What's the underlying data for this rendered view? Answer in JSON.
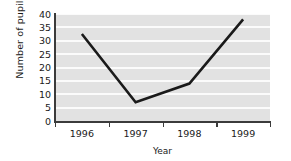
{
  "chart_data": {
    "type": "line",
    "title": "",
    "xlabel": "Year",
    "ylabel": "Number of pupils",
    "categories": [
      "1996",
      "1997",
      "1998",
      "1999"
    ],
    "values": [
      32.5,
      7,
      14,
      38
    ],
    "series": [
      {
        "name": "Number of pupils",
        "values": [
          32.5,
          7,
          14,
          38
        ]
      }
    ],
    "ylim": [
      0,
      40
    ],
    "yticks": [
      0,
      5,
      10,
      15,
      20,
      25,
      30,
      35,
      40
    ],
    "ytick_labels": [
      "0",
      "5",
      "10",
      "15",
      "20",
      "25",
      "30",
      "35",
      "40"
    ],
    "xtick_labels": [
      "1996",
      "1997",
      "1998",
      "1999"
    ],
    "grid": "horizontal",
    "legend": "none",
    "line_color": "#1a1a1a",
    "plot_background": "#e2e2e2",
    "gridline_color": "#fbfbfb",
    "figure_background": "#ffffff",
    "annotations": []
  },
  "axes": {
    "y_title": "Number of pupils",
    "x_title": "Year"
  }
}
